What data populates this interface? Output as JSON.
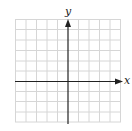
{
  "diagram": {
    "type": "coordinate-grid",
    "x_axis_label": "x",
    "y_axis_label": "y",
    "grid_columns": 10,
    "grid_rows": 10,
    "colors": {
      "grid": "#d4d4d4",
      "axis": "#222222",
      "background": "#ffffff"
    }
  }
}
